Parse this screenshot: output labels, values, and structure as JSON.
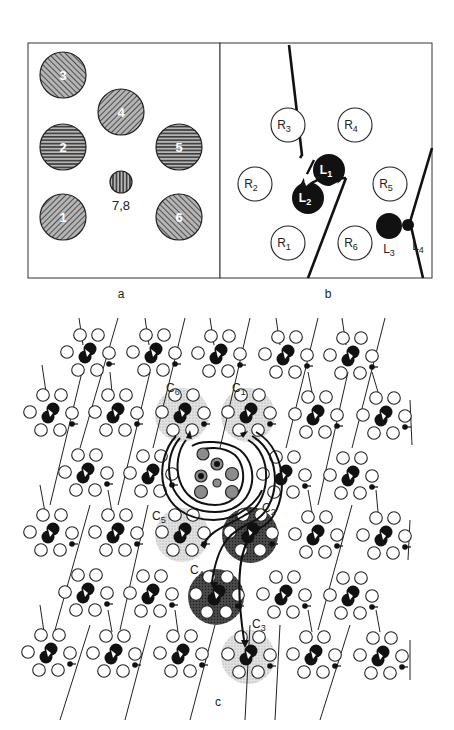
{
  "figure": {
    "panels": [
      {
        "id": "a",
        "label": "a",
        "description": "Six large hatched circles arranged hexagonally around a small central circle",
        "circles": [
          {
            "label": "1",
            "hatch": "diagonal-right"
          },
          {
            "label": "2",
            "hatch": "horizontal"
          },
          {
            "label": "3",
            "hatch": "diagonal-left"
          },
          {
            "label": "4",
            "hatch": "diagonal-right"
          },
          {
            "label": "5",
            "hatch": "horizontal"
          },
          {
            "label": "6",
            "hatch": "diagonal-left"
          },
          {
            "label": "7,8",
            "hatch": "vertical",
            "size": "small"
          }
        ]
      },
      {
        "id": "b",
        "label": "b",
        "receptors": [
          "R1",
          "R2",
          "R3",
          "R4",
          "R5",
          "R6"
        ],
        "ligands": [
          "L1",
          "L2",
          "L3",
          "L4"
        ],
        "sub": {
          "R1": [
            "R",
            "1"
          ],
          "R2": [
            "R",
            "2"
          ],
          "R3": [
            "R",
            "3"
          ],
          "R4": [
            "R",
            "4"
          ],
          "R5": [
            "R",
            "5"
          ],
          "R6": [
            "R",
            "6"
          ],
          "L1": [
            "L",
            "1"
          ],
          "L2": [
            "L",
            "2"
          ],
          "L3": [
            "L",
            "3"
          ],
          "L4": [
            "L",
            "4"
          ]
        }
      },
      {
        "id": "c",
        "label": "c",
        "highlighted_units": [
          {
            "label": "C1",
            "base": "C",
            "sub": "1",
            "shade": "light"
          },
          {
            "label": "C2",
            "base": "C",
            "sub": "2",
            "shade": "dark"
          },
          {
            "label": "C3",
            "base": "C",
            "sub": "3",
            "shade": "light"
          },
          {
            "label": "C4",
            "base": "C",
            "sub": "4",
            "shade": "dark"
          },
          {
            "label": "C5",
            "base": "C",
            "sub": "5",
            "shade": "light"
          },
          {
            "label": "C6",
            "base": "C",
            "sub": "6",
            "shade": "light"
          }
        ]
      }
    ]
  },
  "colors": {
    "ink": "#1a1a1a",
    "light_shade": "#d6d6d6",
    "dark_shade": "#3a3a3a",
    "hatch_fill": "#9a9a9a",
    "spiral_fill": "#8c8c8c"
  }
}
